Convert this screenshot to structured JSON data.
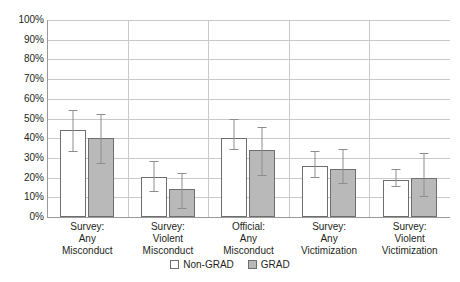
{
  "chart_data": {
    "type": "bar",
    "title": "",
    "subtitle": "",
    "xlabel": "",
    "ylabel": "",
    "ylim": [
      0,
      100
    ],
    "grid": true,
    "legend_position": "bottom",
    "value_suffix": "%",
    "categories": [
      "Survey:\nAny\nMisconduct",
      "Survey:\nViolent\nMisconduct",
      "Official:\nAny\nMisconduct",
      "Survey:\nAny\nVictimization",
      "Survey:\nViolent\nVictimization"
    ],
    "category_lines": [
      [
        "Survey:",
        "Any",
        "Misconduct"
      ],
      [
        "Survey:",
        "Violent",
        "Misconduct"
      ],
      [
        "Official:",
        "Any",
        "Misconduct"
      ],
      [
        "Survey:",
        "Any",
        "Victimization"
      ],
      [
        "Survey:",
        "Violent",
        "Victimization"
      ]
    ],
    "ytick_labels": [
      "100%",
      "90%",
      "80%",
      "70%",
      "60%",
      "50%",
      "40%",
      "30%",
      "20%",
      "10%",
      "0%"
    ],
    "ytick_values": [
      100,
      90,
      80,
      70,
      60,
      50,
      40,
      30,
      20,
      10,
      0
    ],
    "series": [
      {
        "name": "Non-GRAD",
        "color": "#ffffff",
        "edge_color": "#6e6e6e",
        "values": [
          44,
          20.5,
          40,
          26,
          19
        ],
        "err_low": [
          33,
          12.5,
          34,
          20,
          15
        ],
        "err_high": [
          54,
          28,
          49,
          33,
          24
        ]
      },
      {
        "name": "GRAD",
        "color": "#b9b9b9",
        "edge_color": "#6e6e6e",
        "values": [
          40,
          14,
          34,
          24.5,
          20
        ],
        "err_low": [
          27,
          4,
          21,
          17,
          10
        ],
        "err_high": [
          52,
          22,
          45,
          34,
          32
        ]
      }
    ],
    "legend": [
      {
        "label": "Non-GRAD",
        "swatch": "nongrad"
      },
      {
        "label": "GRAD",
        "swatch": "grad"
      }
    ]
  },
  "colors": {
    "gridline": "#c9c9c9",
    "axis": "#9a9a9a",
    "bar_edge": "#6e6e6e",
    "grad_fill": "#b9b9b9",
    "nongrad_fill": "#ffffff",
    "error_bar": "#8d8d8d",
    "text": "#231f20",
    "background": "#ffffff"
  }
}
